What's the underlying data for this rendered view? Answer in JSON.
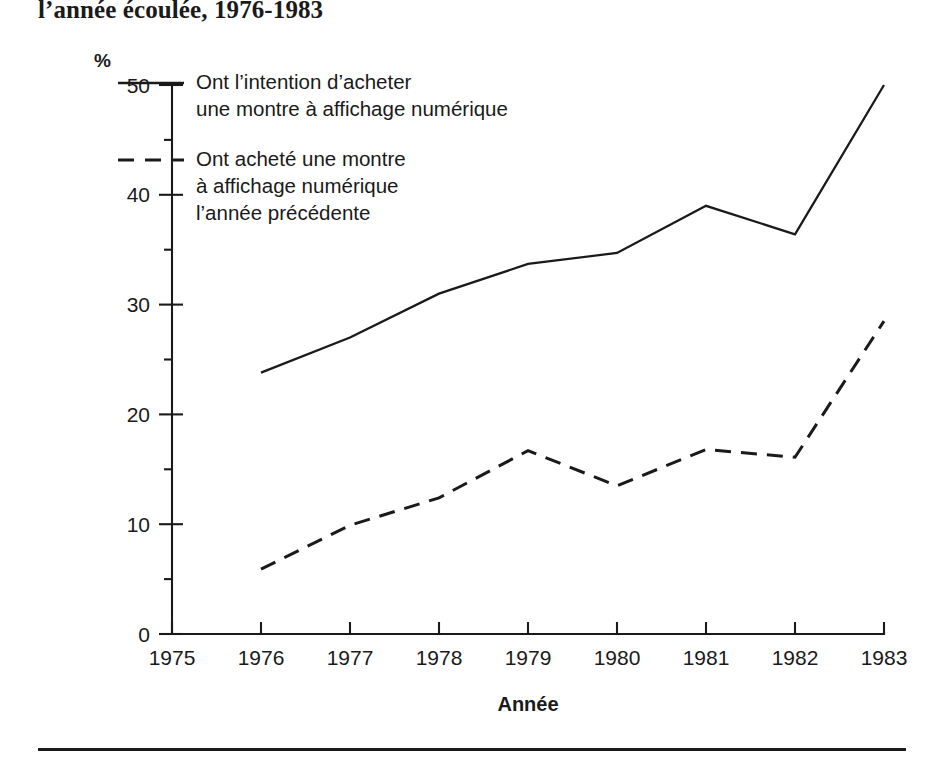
{
  "title": "l’année écoulée, 1976-1983",
  "axes": {
    "y_unit_label": "%",
    "y_ticks": [
      "50",
      "40",
      "30",
      "20",
      "10",
      "0"
    ],
    "x_ticks": [
      "1975",
      "1976",
      "1977",
      "1978",
      "1979",
      "1980",
      "1981",
      "1982",
      "1983"
    ],
    "x_axis_title": "Année"
  },
  "legend": {
    "entries": [
      {
        "style": "solid",
        "lines": [
          "Ont l’intention d’acheter",
          "une montre à affichage numérique"
        ]
      },
      {
        "style": "dashed",
        "lines": [
          "Ont acheté une montre",
          "à affichage numérique",
          "l’année précédente"
        ]
      }
    ]
  },
  "chart_data": {
    "type": "line",
    "title": "l’année écoulée, 1976-1983",
    "xlabel": "Année",
    "ylabel": "%",
    "xlim": [
      1975,
      1983
    ],
    "ylim": [
      0,
      50
    ],
    "y_major_step": 10,
    "y_minor_step": 5,
    "grid": false,
    "legend_position": "top-left inside plot",
    "x": [
      1975,
      1976,
      1977,
      1978,
      1979,
      1980,
      1981,
      1982,
      1983
    ],
    "series": [
      {
        "name": "Ont l’intention d’acheter une montre à affichage numérique",
        "style": "solid",
        "x": [
          1976,
          1977,
          1978,
          1979,
          1980,
          1981,
          1982,
          1983
        ],
        "values": [
          23.8,
          27.0,
          31.0,
          33.7,
          34.7,
          39.0,
          36.4,
          50.0
        ]
      },
      {
        "name": "Ont acheté une montre à affichage numérique l’année précédente",
        "style": "dashed",
        "x": [
          1976,
          1977,
          1978,
          1979,
          1980,
          1981,
          1982,
          1983
        ],
        "values": [
          5.9,
          9.9,
          12.4,
          16.7,
          13.5,
          16.8,
          16.1,
          28.5
        ]
      }
    ]
  }
}
